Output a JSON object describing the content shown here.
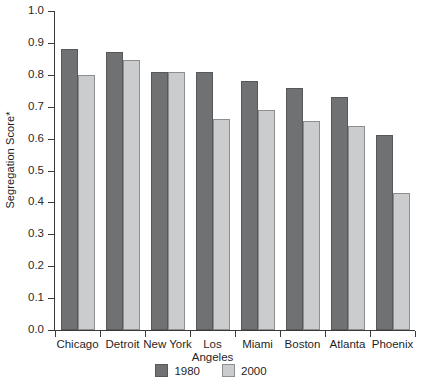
{
  "chart_data": {
    "type": "bar",
    "title": "",
    "xlabel": "",
    "ylabel": "Segregation Score*",
    "ylim": [
      0.0,
      1.0
    ],
    "ytick_labels": [
      "1.0",
      "0.9",
      "0.8",
      "0.7",
      "0.6",
      "0.5",
      "0.4",
      "0.3",
      "0.2",
      "0.1",
      "0.0"
    ],
    "ytick_values": [
      1.0,
      0.9,
      0.8,
      0.7,
      0.6,
      0.5,
      0.4,
      0.3,
      0.2,
      0.1,
      0.0
    ],
    "grid": false,
    "legend_position": "bottom-center",
    "categories": [
      "Chicago",
      "Detroit",
      "New York",
      "Los\nAngeles",
      "Miami",
      "Boston",
      "Atlanta",
      "Phoenix"
    ],
    "series": [
      {
        "name": "1980",
        "color": "#6f7173",
        "values": [
          0.88,
          0.87,
          0.81,
          0.81,
          0.78,
          0.76,
          0.73,
          0.61
        ]
      },
      {
        "name": "2000",
        "color": "#cbcccd",
        "values": [
          0.8,
          0.845,
          0.81,
          0.66,
          0.69,
          0.655,
          0.64,
          0.43
        ]
      }
    ]
  },
  "legend": {
    "items": [
      {
        "label": "1980",
        "swatch": "dark-gray-swatch"
      },
      {
        "label": "2000",
        "swatch": "light-gray-swatch"
      }
    ]
  }
}
